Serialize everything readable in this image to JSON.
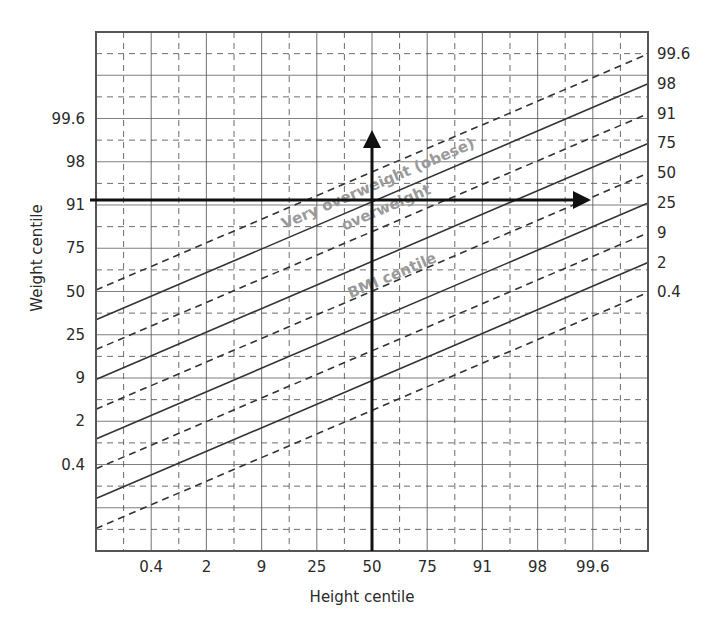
{
  "chart_data": {
    "type": "line",
    "title": "",
    "xlabel": "Height centile",
    "ylabel": "Weight centile",
    "x_ticks": [
      "0.4",
      "2",
      "9",
      "25",
      "50",
      "75",
      "91",
      "98",
      "99.6"
    ],
    "y_ticks_left": [
      "99.6",
      "98",
      "91",
      "75",
      "50",
      "25",
      "9",
      "2",
      "0.4"
    ],
    "bmi_centile_lines": [
      {
        "label": "99.6",
        "style": "dashed"
      },
      {
        "label": "98",
        "style": "solid"
      },
      {
        "label": "91",
        "style": "dashed"
      },
      {
        "label": "75",
        "style": "solid"
      },
      {
        "label": "50",
        "style": "dashed"
      },
      {
        "label": "25",
        "style": "solid"
      },
      {
        "label": "9",
        "style": "dashed"
      },
      {
        "label": "2",
        "style": "solid"
      },
      {
        "label": "0.4",
        "style": "dashed"
      }
    ],
    "bmi_line_endpoints": {
      "note": "each BMI centile line runs diagonally; value expressed in centile-space steps",
      "left_edge_weight_offset_steps": -4,
      "slope_weight_steps_per_height_step": 1
    },
    "grid": true,
    "annotations": [
      {
        "id": "very-overweight",
        "text": "Very overweight (obese)"
      },
      {
        "id": "overweight",
        "text": "overweight"
      },
      {
        "id": "bmi-centile",
        "text": "BMI centile"
      }
    ],
    "arrows": [
      {
        "id": "height-arrow",
        "direction": "up",
        "at_height_centile": "50"
      },
      {
        "id": "weight-arrow",
        "direction": "right",
        "at_weight_centile": "91"
      }
    ],
    "colors": {
      "grid": "#555555",
      "bmi_line": "#333333",
      "arrow": "#111111",
      "annotation": "#9a9a9a",
      "text": "#2a2a2a"
    }
  }
}
